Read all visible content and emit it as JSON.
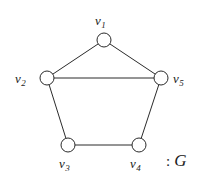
{
  "figure": {
    "type": "graph-diagram",
    "background_color": "#ffffff",
    "stroke_color": "#2b2b2b",
    "vertex_fill": "#ffffff",
    "vertex_radius": 7,
    "edge_width": 1,
    "caption": {
      "separator": ":",
      "name": "G"
    },
    "vertices": [
      {
        "id": "v1",
        "label": "v",
        "subscript": "1",
        "cx": 104,
        "cy": 40,
        "label_pos": "above"
      },
      {
        "id": "v2",
        "label": "v",
        "subscript": "2",
        "cx": 47,
        "cy": 78,
        "label_pos": "left"
      },
      {
        "id": "v3",
        "label": "v",
        "subscript": "3",
        "cx": 68,
        "cy": 145,
        "label_pos": "below"
      },
      {
        "id": "v4",
        "label": "v",
        "subscript": "4",
        "cx": 139,
        "cy": 145,
        "label_pos": "below"
      },
      {
        "id": "v5",
        "label": "v",
        "subscript": "5",
        "cx": 161,
        "cy": 78,
        "label_pos": "right"
      }
    ],
    "edges": [
      {
        "from": "v1",
        "to": "v2"
      },
      {
        "from": "v1",
        "to": "v5"
      },
      {
        "from": "v2",
        "to": "v5"
      },
      {
        "from": "v2",
        "to": "v3"
      },
      {
        "from": "v3",
        "to": "v4"
      },
      {
        "from": "v4",
        "to": "v5"
      }
    ]
  }
}
